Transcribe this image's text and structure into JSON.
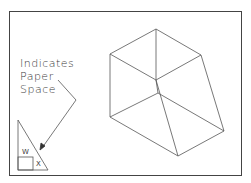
{
  "annotation": {
    "lines": [
      "Indicates",
      "Paper",
      "Space"
    ]
  },
  "ucs_icon": {
    "label_w": "W",
    "label_x": "X"
  },
  "colors": {
    "line": "#555555",
    "frame": "#444444",
    "background": "#ffffff"
  }
}
